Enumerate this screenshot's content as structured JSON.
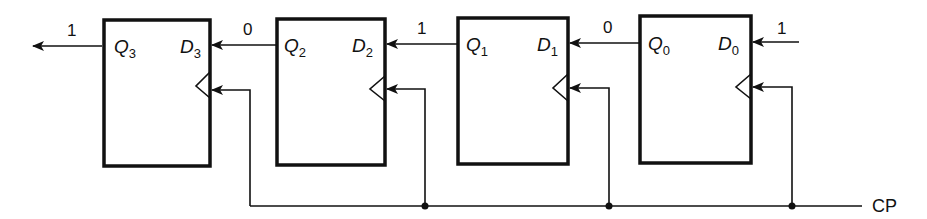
{
  "diagram": {
    "type": "shift-register",
    "clock_label": "CP",
    "flip_flops": [
      {
        "q": "Q",
        "q_sub": "3",
        "d": "D",
        "d_sub": "3"
      },
      {
        "q": "Q",
        "q_sub": "2",
        "d": "D",
        "d_sub": "2"
      },
      {
        "q": "Q",
        "q_sub": "1",
        "d": "D",
        "d_sub": "1"
      },
      {
        "q": "Q",
        "q_sub": "0",
        "d": "D",
        "d_sub": "0"
      }
    ],
    "signals": {
      "output_q3": "1",
      "q2_to_d3": "0",
      "q1_to_d2": "1",
      "q0_to_d1": "0",
      "input_d0": "1"
    }
  }
}
